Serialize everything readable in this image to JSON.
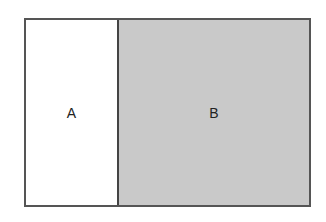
{
  "diagram": {
    "regions": [
      {
        "label": "A",
        "fill": "#ffffff"
      },
      {
        "label": "B",
        "fill": "#c9c9c9"
      }
    ],
    "border_color": "#555555"
  }
}
